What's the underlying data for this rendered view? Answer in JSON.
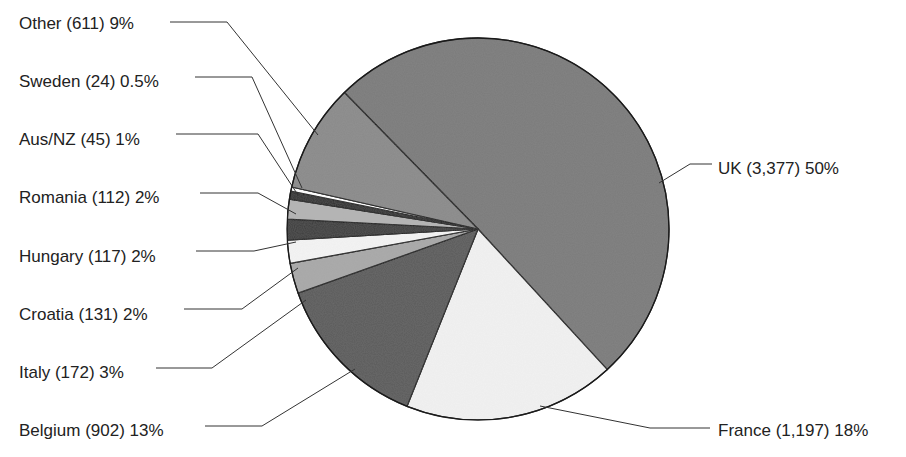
{
  "chart_data": {
    "type": "pie",
    "title": "",
    "start_angle_deg": -134.4,
    "direction": "clockwise",
    "center": [
      478,
      229
    ],
    "radius": 191,
    "slices": [
      {
        "name": "UK",
        "count": 3377,
        "count_label": "3,377",
        "percent": 50,
        "pct_label": "50%",
        "color": "#7a7a7a",
        "label": "UK (3,377) 50%",
        "label_x": 718,
        "label_y": 174,
        "anchor": "start",
        "line": [
          [
            659,
            183
          ],
          [
            690,
            164
          ],
          [
            712,
            164
          ]
        ]
      },
      {
        "name": "France",
        "count": 1197,
        "count_label": "1,197",
        "percent": 18,
        "pct_label": "18%",
        "color": "#f2f2f2",
        "label": "France (1,197) 18%",
        "label_x": 718,
        "label_y": 436,
        "anchor": "start",
        "line": [
          [
            540,
            406
          ],
          [
            650,
            428
          ],
          [
            710,
            428
          ]
        ]
      },
      {
        "name": "Belgium",
        "count": 902,
        "count_label": "902",
        "percent": 13,
        "pct_label": "13%",
        "color": "#5a5a5a",
        "label": "Belgium (902) 13%",
        "label_x": 19,
        "label_y": 436,
        "anchor": "start",
        "line": [
          [
            355,
            369
          ],
          [
            262,
            426
          ],
          [
            205,
            426
          ]
        ]
      },
      {
        "name": "Italy",
        "count": 172,
        "count_label": "172",
        "percent": 3,
        "pct_label": "3%",
        "color": "#a8a8a8",
        "label": "Italy (172) 3%",
        "label_x": 19,
        "label_y": 378,
        "anchor": "start",
        "line": [
          [
            306,
            300
          ],
          [
            212,
            368
          ],
          [
            156,
            368
          ]
        ]
      },
      {
        "name": "Croatia",
        "count": 131,
        "count_label": "131",
        "percent": 2,
        "pct_label": "2%",
        "color": "#f4f4f4",
        "label": "Croatia (131) 2%",
        "label_x": 19,
        "label_y": 320,
        "anchor": "start",
        "line": [
          [
            298,
            268
          ],
          [
            242,
            309
          ],
          [
            184,
            309
          ]
        ]
      },
      {
        "name": "Hungary",
        "count": 117,
        "count_label": "117",
        "percent": 2,
        "pct_label": "2%",
        "color": "#3a3a3a",
        "label": "Hungary (117) 2%",
        "label_x": 19,
        "label_y": 262,
        "anchor": "start",
        "line": [
          [
            296,
            242
          ],
          [
            254,
            251
          ],
          [
            196,
            251
          ]
        ]
      },
      {
        "name": "Romania",
        "count": 112,
        "count_label": "112",
        "percent": 2,
        "pct_label": "2%",
        "color": "#b4b4b4",
        "label": "Romania (112) 2%",
        "label_x": 19,
        "label_y": 203,
        "anchor": "start",
        "line": [
          [
            296,
            214
          ],
          [
            258,
            193
          ],
          [
            200,
            193
          ]
        ]
      },
      {
        "name": "Aus/NZ",
        "count": 45,
        "count_label": "45",
        "percent": 1,
        "pct_label": "1%",
        "color": "#2e2e2e",
        "label": "Aus/NZ (45) 1%",
        "label_x": 19,
        "label_y": 145,
        "anchor": "start",
        "line": [
          [
            298,
            195
          ],
          [
            258,
            134
          ],
          [
            176,
            134
          ]
        ]
      },
      {
        "name": "Sweden",
        "count": 24,
        "count_label": "24",
        "percent": 0.5,
        "pct_label": "0.5%",
        "color": "#ffffff",
        "label": "Sweden (24) 0.5%",
        "label_x": 19,
        "label_y": 87,
        "anchor": "start",
        "line": [
          [
            302,
            188
          ],
          [
            252,
            77
          ],
          [
            195,
            77
          ]
        ]
      },
      {
        "name": "Other",
        "count": 611,
        "count_label": "611",
        "percent": 9,
        "pct_label": "9%",
        "color": "#8a8a8a",
        "label": "Other (611) 9%",
        "label_x": 19,
        "label_y": 29,
        "anchor": "start",
        "line": [
          [
            318,
            135
          ],
          [
            227,
            22
          ],
          [
            170,
            22
          ]
        ]
      }
    ],
    "legend": "none (direct labels with leader lines)"
  }
}
